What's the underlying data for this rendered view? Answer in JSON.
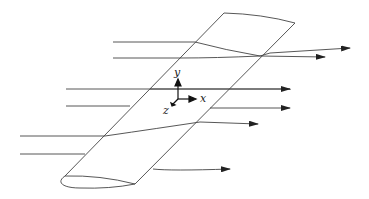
{
  "figure": {
    "axis_labels": {
      "x": "x",
      "y": "y",
      "z": "z"
    },
    "colors": {
      "stroke": "#333333",
      "background": "#ffffff"
    }
  }
}
